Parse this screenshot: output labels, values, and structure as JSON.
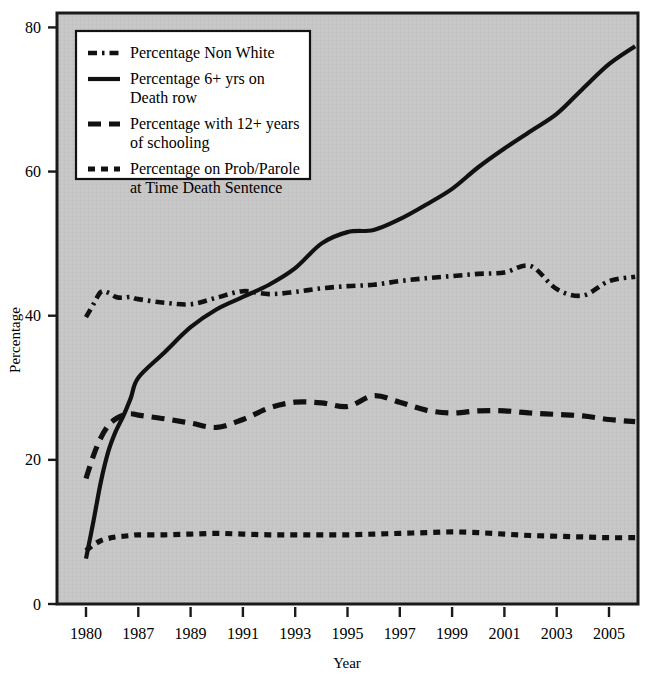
{
  "chart_data": {
    "type": "line",
    "title": "",
    "xlabel": "Year",
    "ylabel": "Percentage",
    "xlim": [
      1980,
      2006
    ],
    "ylim": [
      0,
      82
    ],
    "yticks": [
      0,
      20,
      40,
      60,
      80
    ],
    "xticks": [
      1980,
      1987,
      1989,
      1991,
      1993,
      1995,
      1997,
      1999,
      2001,
      2003,
      2005
    ],
    "xtick_labels": [
      "1980",
      "1987",
      "1989",
      "1991",
      "1993",
      "1995",
      "1997",
      "1999",
      "2001",
      "2003",
      "2005"
    ],
    "ytick_labels": [
      "0",
      "20",
      "40",
      "60",
      "80"
    ],
    "grid": false,
    "legend_position": "upper-left",
    "plot_background": "#c6c6c6",
    "line_color": "#111111",
    "x": [
      1980,
      1981,
      1982,
      1983,
      1984,
      1985,
      1986,
      1987,
      1988,
      1989,
      1990,
      1991,
      1992,
      1993,
      1994,
      1995,
      1996,
      1997,
      1998,
      1999,
      2000,
      2001,
      2002,
      2003,
      2004,
      2005,
      2006
    ],
    "series": [
      {
        "name": "Percentage Non White",
        "style": "dashdot",
        "values": [
          39.8,
          41.6,
          43.3,
          43.2,
          42.6,
          42.5,
          42.6,
          42.3,
          41.8,
          41.6,
          42.5,
          43.4,
          43.0,
          43.3,
          43.8,
          44.1,
          44.3,
          44.8,
          45.2,
          45.5,
          45.8,
          46.0,
          46.9,
          43.7,
          42.8,
          44.8,
          45.4
        ]
      },
      {
        "name": "Percentage 6+ yrs on Death row",
        "style": "solid",
        "values": [
          6.3,
          11.5,
          17.0,
          21.2,
          24.0,
          26.1,
          28.6,
          31.4,
          34.9,
          38.4,
          40.9,
          42.6,
          44.3,
          46.6,
          50.0,
          51.6,
          51.9,
          53.4,
          55.4,
          57.6,
          60.6,
          63.2,
          65.6,
          68.0,
          71.5,
          74.9,
          77.4
        ]
      },
      {
        "name": "Percentage with 12+ years of schooling",
        "style": "dashed",
        "values": [
          17.4,
          20.6,
          23.1,
          24.8,
          25.7,
          26.2,
          26.4,
          26.2,
          25.7,
          25.1,
          24.5,
          25.6,
          27.2,
          28.0,
          27.9,
          27.4,
          28.9,
          28.0,
          26.9,
          26.5,
          26.8,
          26.8,
          26.5,
          26.3,
          26.1,
          25.6,
          25.3
        ]
      },
      {
        "name": "Percentage on Prob/Parole at Time Death Sentence",
        "style": "dotted",
        "values": [
          7.4,
          8.2,
          8.8,
          9.1,
          9.3,
          9.4,
          9.5,
          9.6,
          9.6,
          9.7,
          9.8,
          9.7,
          9.6,
          9.6,
          9.6,
          9.6,
          9.7,
          9.8,
          9.9,
          10.0,
          9.9,
          9.7,
          9.5,
          9.4,
          9.3,
          9.2,
          9.2
        ]
      }
    ]
  },
  "legend": {
    "items": [
      {
        "label_lines": [
          "Percentage Non White"
        ],
        "style": "dashdot"
      },
      {
        "label_lines": [
          "Percentage 6+ yrs on",
          "Death row"
        ],
        "style": "solid"
      },
      {
        "label_lines": [
          "Percentage with 12+ years",
          "of schooling"
        ],
        "style": "dashed"
      },
      {
        "label_lines": [
          "Percentage on Prob/Parole",
          "at Time Death Sentence"
        ],
        "style": "dotted"
      }
    ]
  },
  "axes": {
    "x_title": "Year",
    "y_title": "Percentage"
  }
}
